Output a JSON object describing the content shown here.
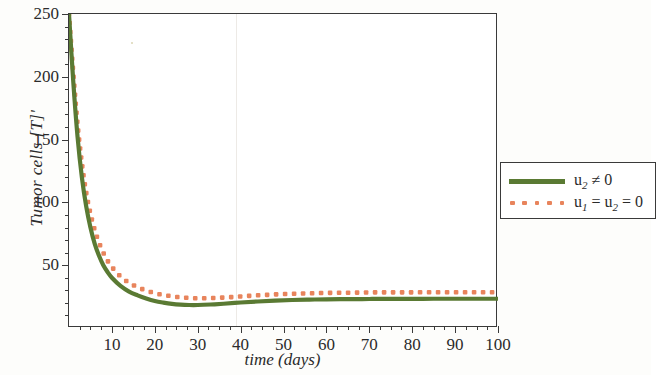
{
  "chart_data": {
    "type": "line",
    "title": "",
    "xlabel": "time (days)",
    "ylabel": "Tumor cells [T]'",
    "xlim": [
      0,
      100
    ],
    "ylim": [
      0,
      250
    ],
    "xticks": [
      10,
      20,
      30,
      40,
      50,
      60,
      70,
      80,
      90,
      100
    ],
    "yticks": [
      50,
      100,
      150,
      200,
      250
    ],
    "xtick_labels": [
      "10",
      "20",
      "30",
      "40",
      "50",
      "60",
      "70",
      "80",
      "90",
      "100"
    ],
    "ytick_labels": [
      "50",
      "100",
      "150",
      "200",
      "250"
    ],
    "grid": false,
    "legend_position": "right",
    "series": [
      {
        "name": "u2 != 0",
        "label_html": "u<sub>2</sub> ≠ 0",
        "style": "solid",
        "color": "#5a7a33",
        "x": [
          0,
          1,
          2,
          3,
          4,
          5,
          6,
          7,
          8,
          9,
          10,
          12,
          14,
          16,
          18,
          20,
          22,
          24,
          26,
          28,
          30,
          33,
          36,
          40,
          44,
          48,
          52,
          56,
          60,
          65,
          70,
          75,
          80,
          85,
          90,
          95,
          100
        ],
        "values": [
          250,
          196,
          152,
          120,
          97,
          80,
          67,
          57.5,
          50,
          44.5,
          40,
          33.5,
          29,
          26,
          23.5,
          21.5,
          20.2,
          19.2,
          18.6,
          18.3,
          18.3,
          18.7,
          19.3,
          20.3,
          21.1,
          21.8,
          22.3,
          22.6,
          22.8,
          23.0,
          23.1,
          23.2,
          23.2,
          23.3,
          23.3,
          23.3,
          23.3
        ]
      },
      {
        "name": "u1 = u2 = 0",
        "label_html": "u<sub>1</sub> = u<sub>2</sub> = 0",
        "style": "dotted",
        "color": "#e8845c",
        "x": [
          0,
          1,
          2,
          3,
          4,
          5,
          6,
          7,
          8,
          9,
          10,
          12,
          14,
          16,
          18,
          20,
          22,
          24,
          26,
          28,
          30,
          33,
          36,
          40,
          44,
          48,
          52,
          56,
          60,
          65,
          70,
          75,
          80,
          85,
          90,
          95,
          100
        ],
        "values": [
          250,
          203,
          162,
          131,
          108,
          91,
          78,
          68,
          60,
          53.5,
          48.5,
          41,
          36,
          32.5,
          29.8,
          27.8,
          26.3,
          25.2,
          24.4,
          23.9,
          23.7,
          23.8,
          24.2,
          25.1,
          26.0,
          26.7,
          27.2,
          27.6,
          27.9,
          28.1,
          28.3,
          28.4,
          28.4,
          28.5,
          28.5,
          28.5,
          28.5
        ]
      }
    ]
  },
  "legend": {
    "entries": [
      {
        "label": "u2 ≠ 0",
        "color": "#5a7a33",
        "style": "solid"
      },
      {
        "label": "u1 = u2 = 0",
        "color": "#e8845c",
        "style": "dotted"
      }
    ]
  },
  "axes": {
    "y_title": "Tumor cells [T]'",
    "x_title": "time (days)"
  },
  "colors": {
    "green": "#5a7a33",
    "orange": "#e8845c",
    "axis": "#3a3a3a",
    "text": "#2b2b2b",
    "background": "#ffffff"
  }
}
